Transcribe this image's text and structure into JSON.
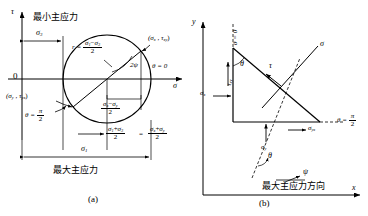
{
  "figure": {
    "panel_a": {
      "caption": "(a)",
      "axis_tau": "τ",
      "axis_sigma": "σ",
      "origin": "0",
      "min_principal_text": "最小主应力",
      "max_principal_text": "最大主应力",
      "sigma3": "σ",
      "sigma3_sub": "3",
      "sigma1": "σ",
      "sigma1_sub": "1",
      "radius_prefix": "r =",
      "radius_num_a": "σ",
      "radius_num_a_sub": "1",
      "radius_minus": "−",
      "radius_num_b": "σ",
      "radius_num_b_sub": "3",
      "radius_den": "2",
      "point_x": "(σ",
      "point_x_sub": "x",
      "point_x_mid": " , τ",
      "point_x_sub2": "xy",
      "point_x_end": ")",
      "point_y": "(σ",
      "point_y_sub": "y",
      "point_y_mid": " , τ",
      "point_y_sub2": "yx",
      "point_y_end": ")",
      "theta_zero": "θ = 0",
      "theta_pi_label": "θ =",
      "theta_pi_num": "π",
      "theta_pi_den": "2",
      "two_psi": "2ψ",
      "diff_num_a": "σ",
      "diff_num_a_sub": "x",
      "diff_minus": "−",
      "diff_num_b": "σ",
      "diff_num_b_sub": "y",
      "diff_den": "2",
      "center_num_a": "σ",
      "center_num_a_sub": "1",
      "center_plus": "+",
      "center_num_b": "σ",
      "center_num_b_sub": "3",
      "center_den": "2",
      "equals": "=",
      "center2_num_a": "σ",
      "center2_num_a_sub": "x",
      "center2_plus": "+",
      "center2_num_b": "σ",
      "center2_num_b_sub": "y",
      "center2_den": "2"
    },
    "panel_b": {
      "caption": "(b)",
      "axis_y": "y",
      "axis_x": "x",
      "theta_zero": "θ = 0",
      "theta_pi_label": "θ =",
      "theta_pi_num": "π",
      "theta_pi_den": "2",
      "sigma": "σ",
      "tau": "τ",
      "theta": "θ",
      "psi": "ψ",
      "tau_xy": "τ",
      "tau_xy_sub": "xy",
      "sigma_x": "σ",
      "sigma_x_sub": "x",
      "sigma_y": "σ",
      "sigma_y_sub": "y",
      "sigma_yx": "σ",
      "sigma_yx_sub": "yx",
      "max_dir_text": "最大主应力方向"
    }
  },
  "colors": {
    "ink": "#000000",
    "paper": "#ffffff"
  }
}
